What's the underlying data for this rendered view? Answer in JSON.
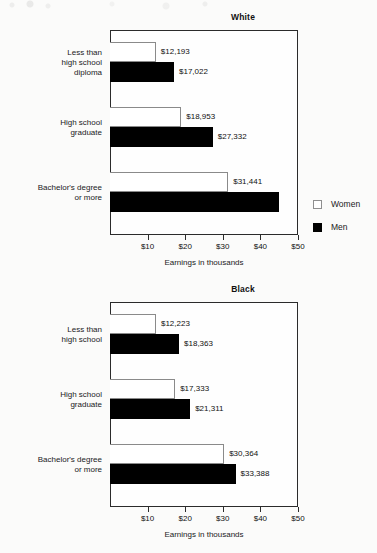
{
  "chart_data": [
    {
      "type": "bar",
      "title": "White",
      "orientation": "horizontal",
      "xlabel": "Earnings in thousands",
      "ylabel": "",
      "xlim": [
        0,
        50
      ],
      "xticks": [
        10,
        20,
        30,
        40,
        50
      ],
      "xtick_labels": [
        "$10",
        "$20",
        "$30",
        "$40",
        "$50"
      ],
      "grid": false,
      "legend_position": "right",
      "categories": [
        "Less than\nhigh school\ndiploma",
        "High school\ngraduate",
        "Bachelor's degree\nor more"
      ],
      "series": [
        {
          "name": "Women",
          "color": "#ffffff",
          "values": [
            12193,
            18953,
            31441
          ],
          "value_labels": [
            "$12,193",
            "$18,953",
            "$31,441"
          ]
        },
        {
          "name": "Men",
          "color": "#000000",
          "values": [
            17022,
            27332,
            45000
          ],
          "value_labels": [
            "$17,022",
            "$27,332",
            ""
          ]
        }
      ]
    },
    {
      "type": "bar",
      "title": "Black",
      "orientation": "horizontal",
      "xlabel": "Earnings in thousands",
      "ylabel": "",
      "xlim": [
        0,
        50
      ],
      "xticks": [
        10,
        20,
        30,
        40,
        50
      ],
      "xtick_labels": [
        "$10",
        "$20",
        "$30",
        "$40",
        "$50"
      ],
      "grid": false,
      "legend_position": "none",
      "categories": [
        "Less than\nhigh school",
        "High school\ngraduate",
        "Bachelor's degree\nor more"
      ],
      "series": [
        {
          "name": "Women",
          "color": "#ffffff",
          "values": [
            12223,
            17333,
            30364
          ],
          "value_labels": [
            "$12,223",
            "$17,333",
            "$30,364"
          ]
        },
        {
          "name": "Men",
          "color": "#000000",
          "values": [
            18363,
            21311,
            33388
          ],
          "value_labels": [
            "$18,363",
            "$21,311",
            "$33,388"
          ]
        }
      ]
    }
  ],
  "legend": {
    "women_label": "Women",
    "men_label": "Men"
  }
}
